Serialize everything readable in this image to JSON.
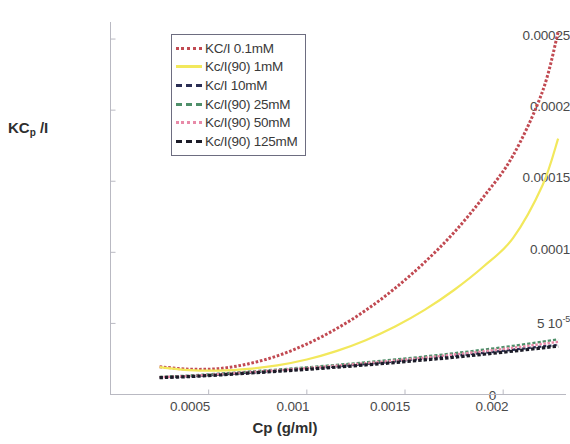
{
  "chart_data": {
    "type": "line",
    "title": "",
    "xlabel": "Cp (g/ml)",
    "ylabel": "KCp /I",
    "ylabel_main": "KC",
    "ylabel_sub": "p",
    "ylabel_tail": " /I",
    "xlim": [
      0.0,
      0.00232
    ],
    "ylim": [
      0.0,
      0.000262
    ],
    "grid": false,
    "legend_position": "upper-left-inside",
    "xticks": [
      0.0005,
      0.001,
      0.0015,
      0.002
    ],
    "xtick_labels": [
      "0.0005",
      "0.001",
      "0.0015",
      "0.002"
    ],
    "yticks": [
      5e-05,
      0.0001,
      0.00015,
      0.0002,
      0.00025
    ],
    "ytick_labels": [
      "5 10-5",
      "0.0001",
      "0.00015",
      "0.0002",
      "0.00025"
    ],
    "ytick_label_5e5_mantissa": "5 10",
    "ytick_label_5e5_exponent": "-5",
    "origin_tick_label": "0",
    "x": [
      0.00025,
      0.0004,
      0.00055,
      0.0007,
      0.00085,
      0.001,
      0.00115,
      0.0013,
      0.00145,
      0.0016,
      0.00175,
      0.0019,
      0.00205,
      0.0022,
      0.00228
    ],
    "series": [
      {
        "name": "KC/I 0.1mM",
        "color": "#c14a52",
        "style": "dotted-thick",
        "values": [
          1.95e-05,
          1.78e-05,
          1.82e-05,
          2.15e-05,
          2.72e-05,
          3.55e-05,
          4.62e-05,
          5.92e-05,
          7.48e-05,
          9.3e-05,
          0.000114,
          0.000139,
          0.000168,
          0.000213,
          0.000255
        ]
      },
      {
        "name": "Kc/I(90) 1mM",
        "color": "#f2e85c",
        "style": "solid",
        "values": [
          1.92e-05,
          1.72e-05,
          1.68e-05,
          1.8e-05,
          2.05e-05,
          2.46e-05,
          3.05e-05,
          3.82e-05,
          4.78e-05,
          5.95e-05,
          7.35e-05,
          9e-05,
          0.00011,
          0.000147,
          0.00018
        ]
      },
      {
        "name": "Kc/I 10mM",
        "color": "#2b2f55",
        "style": "dashed",
        "values": [
          1.2e-05,
          1.28e-05,
          1.4e-05,
          1.53e-05,
          1.67e-05,
          1.82e-05,
          1.98e-05,
          2.15e-05,
          2.33e-05,
          2.52e-05,
          2.72e-05,
          2.93e-05,
          3.15e-05,
          3.38e-05,
          3.48e-05
        ]
      },
      {
        "name": "Kc/I(90) 25mM",
        "color": "#4f8f6a",
        "style": "dashed",
        "values": [
          1.24e-05,
          1.33e-05,
          1.46e-05,
          1.6e-05,
          1.75e-05,
          1.91e-05,
          2.08e-05,
          2.26e-05,
          2.46e-05,
          2.67e-05,
          2.9e-05,
          3.15e-05,
          3.42e-05,
          3.72e-05,
          3.88e-05
        ]
      },
      {
        "name": "Kc/I(90) 50mM",
        "color": "#e88aa8",
        "style": "dotted",
        "values": [
          1.22e-05,
          1.31e-05,
          1.43e-05,
          1.57e-05,
          1.71e-05,
          1.86e-05,
          2.03e-05,
          2.2e-05,
          2.39e-05,
          2.59e-05,
          2.81e-05,
          3.04e-05,
          3.29e-05,
          3.56e-05,
          3.7e-05
        ]
      },
      {
        "name": "Kc/I(90) 125mM",
        "color": "#1c1c28",
        "style": "dashed-thick",
        "values": [
          1.18e-05,
          1.26e-05,
          1.37e-05,
          1.5e-05,
          1.63e-05,
          1.77e-05,
          1.92e-05,
          2.08e-05,
          2.25e-05,
          2.43e-05,
          2.62e-05,
          2.83e-05,
          3.05e-05,
          3.28e-05,
          3.4e-05
        ]
      }
    ]
  },
  "legend": {
    "items": [
      {
        "label": "KC/I 0.1mM",
        "color": "#c14a52"
      },
      {
        "label": "Kc/I(90) 1mM",
        "color": "#f2e85c"
      },
      {
        "label": "Kc/I 10mM",
        "color": "#2b2f55"
      },
      {
        "label": "Kc/I(90) 25mM",
        "color": "#4f8f6a"
      },
      {
        "label": "Kc/I(90) 50mM",
        "color": "#e88aa8"
      },
      {
        "label": "Kc/I(90) 125mM",
        "color": "#1c1c28"
      }
    ]
  }
}
